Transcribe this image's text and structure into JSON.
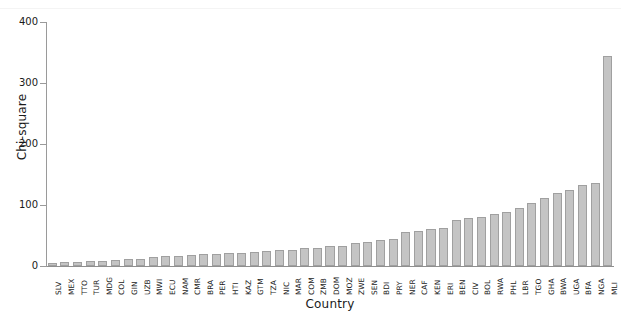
{
  "figure": {
    "caption_fragment": "",
    "bar_color": "#c4c4c4",
    "bar_edge_color": "#a0a0a0",
    "axis_color": "#9a9a9a"
  },
  "chart_data": {
    "type": "bar",
    "title": "",
    "xlabel": "Country",
    "ylabel": "Chi-square",
    "ylim": [
      0,
      400
    ],
    "yticks": [
      0,
      100,
      200,
      300,
      400
    ],
    "ytick_labels": [
      "0",
      "100",
      "200",
      "300",
      "400"
    ],
    "grid": false,
    "legend": null,
    "categories": [
      "SLV",
      "MEX",
      "TTO",
      "TUR",
      "MDG",
      "COL",
      "GIN",
      "UZB",
      "MWI",
      "ECU",
      "NAM",
      "CMR",
      "BRA",
      "PER",
      "HTI",
      "KAZ",
      "GTM",
      "TZA",
      "NIC",
      "MAR",
      "COM",
      "ZMB",
      "DOM",
      "MOZ",
      "ZWE",
      "SEN",
      "BDI",
      "PRY",
      "NER",
      "CAF",
      "KEN",
      "ERI",
      "BEN",
      "CIV",
      "BOL",
      "RWA",
      "PHL",
      "LBR",
      "TGO",
      "GHA",
      "BWA",
      "UGA",
      "BFA",
      "NGA",
      "MLI"
    ],
    "values": [
      5,
      6,
      7,
      8,
      9,
      10,
      11,
      12,
      14,
      16,
      17,
      18,
      19,
      20,
      21,
      22,
      23,
      24,
      26,
      27,
      29,
      30,
      32,
      33,
      37,
      40,
      42,
      45,
      55,
      58,
      60,
      62,
      75,
      78,
      80,
      85,
      88,
      95,
      104,
      112,
      120,
      125,
      133,
      136,
      345
    ]
  }
}
